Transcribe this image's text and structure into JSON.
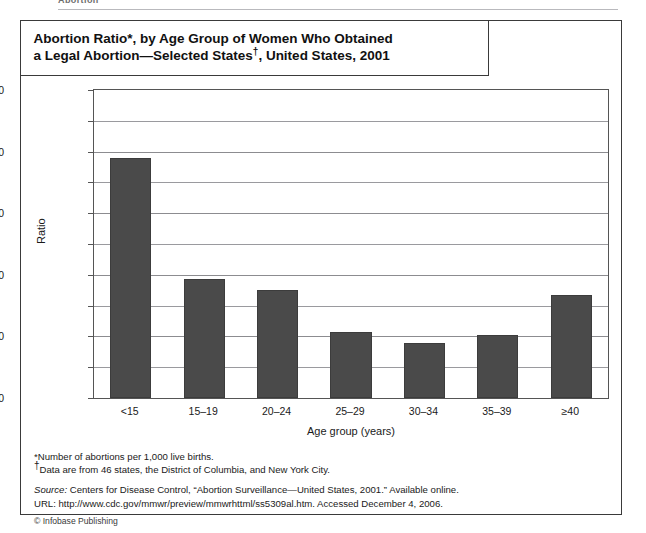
{
  "page_header": {
    "running_head": "Abortion"
  },
  "figure": {
    "title_line1": "Abortion Ratio*, by Age Group of Women Who Obtained",
    "title_line2_a": "a Legal Abortion—Selected States",
    "title_line2_dagger": "†",
    "title_line2_b": ", United States, 2001",
    "notes": [
      "*Number of abortions per 1,000 live births.",
      "Data are from 46 states, the District of Columbia, and New York City."
    ],
    "note2_marker": "†",
    "source_label": "Source:",
    "source_text": " Centers for Disease Control, “Abortion Surveillance—United States, 2001.” Available online.",
    "url_line": "URL: http://www.cdc.gov/mmwr/preview/mmwrhttml/ss5309al.htm.  Accessed December 4, 2006.",
    "copyright": "© Infobase Publishing"
  },
  "chart_data": {
    "type": "bar",
    "title": "Abortion Ratio*, by Age Group of Women Who Obtained a Legal Abortion—Selected States†, United States, 2001",
    "xlabel": "Age group (years)",
    "ylabel": "Ratio",
    "categories": [
      "<15",
      "15–19",
      "20–24",
      "25–29",
      "30–34",
      "35–39",
      "≥40"
    ],
    "values": [
      780,
      385,
      352,
      215,
      180,
      205,
      335
    ],
    "ylim": [
      0,
      1000
    ],
    "ytick_labels": [
      "0",
      "200",
      "400",
      "600",
      "800",
      "1000"
    ],
    "ytick_values": [
      0,
      200,
      400,
      600,
      800,
      1000
    ],
    "minor_tick_values": [
      100,
      300,
      500,
      700,
      900
    ],
    "grid": true,
    "legend": "none",
    "bar_color": "#4a4a4a"
  }
}
